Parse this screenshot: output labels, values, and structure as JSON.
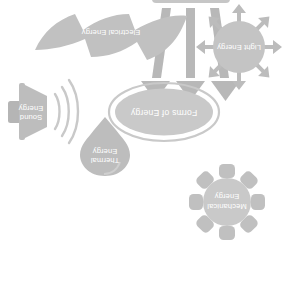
{
  "diagram": {
    "title": "Forms of Energy",
    "rotation_degrees": 180,
    "background_color": "#ffffff",
    "center": {
      "label": "Forms of Energy",
      "shape": "ellipse-outline",
      "fill_color": "#c9c9c9",
      "outline_color": "#c9c9c9",
      "text_color": "#ffffff"
    },
    "nodes": [
      {
        "id": "mechanical",
        "label_line1": "Mechanical",
        "label_line2": "Energy",
        "shape": "gear-icon",
        "fill_color": "#c9c9c9",
        "text_color": "#ffffff"
      },
      {
        "id": "thermal",
        "label_line1": "Thermal",
        "label_line2": "Energy",
        "shape": "droplet-flame-icon",
        "fill_color": "#bdbdbd",
        "text_color": "#ffffff"
      },
      {
        "id": "sound",
        "label_line1": "Sound",
        "label_line2": "Energy",
        "shape": "speaker-icon",
        "fill_color": "#bdbdbd",
        "text_color": "#ffffff"
      },
      {
        "id": "light",
        "label_line1": "Light Energy",
        "label_line2": "",
        "shape": "sun-burst-icon",
        "fill_color": "#c4c4c4",
        "text_color": "#ffffff"
      },
      {
        "id": "electrical",
        "label_line1": "Electrical Energy",
        "label_line2": "",
        "shape": "lightning-bolt-icon",
        "fill_color": "#c1c1c1",
        "text_color": "#ffffff"
      },
      {
        "id": "arrows",
        "label_line1": "",
        "label_line2": "",
        "shape": "three-arrows-icon",
        "fill_color": "#c6c6c6",
        "text_color": "#ffffff"
      }
    ]
  }
}
